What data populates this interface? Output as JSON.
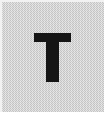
{
  "image": {
    "width": 106,
    "height": 114,
    "kind": "letter-tile-icon",
    "description": "Square light-gray dithered tile with a single bold black capital letter centered"
  },
  "tile": {
    "background_color": "#c9c9c9",
    "texture": "checkerboard-dither",
    "edge_highlight_color": "#f2f2f2",
    "edge_shadow_color": "#ffffff"
  },
  "glyph": {
    "character": "T",
    "label": "letter-t",
    "color": "#151515",
    "weight": "bold",
    "style": "sans-serif",
    "case": "uppercase",
    "left": 34,
    "top": 33,
    "width": 37,
    "height": 49
  }
}
